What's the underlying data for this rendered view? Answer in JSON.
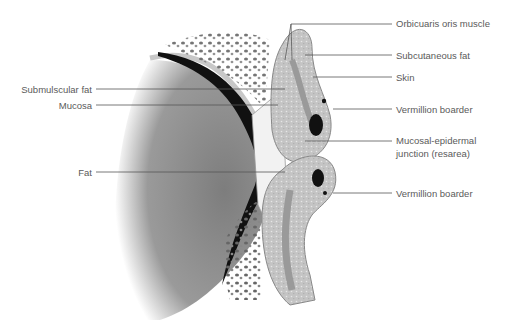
{
  "figure": {
    "type": "anatomical cross-section diagram"
  },
  "labels_right": [
    {
      "id": "orbicularis",
      "text": "Orbicuaris oris muscle"
    },
    {
      "id": "subcutaneous",
      "text": "Subcutaneous fat"
    },
    {
      "id": "skin",
      "text": "Skin"
    },
    {
      "id": "vermillion_upper",
      "text": "Vermillion boarder"
    },
    {
      "id": "mucosal_junction_1",
      "text": "Mucosal-epidermal"
    },
    {
      "id": "mucosal_junction_2",
      "text": "junction (resarea)"
    },
    {
      "id": "vermillion_lower",
      "text": "Vermillion boarder"
    }
  ],
  "labels_left": [
    {
      "id": "submuscular",
      "text": "Submulscular fat"
    },
    {
      "id": "mucosa",
      "text": "Mucosa"
    },
    {
      "id": "fat",
      "text": "Fat"
    }
  ],
  "colors": {
    "leader_line": "#555555",
    "label_text": "#5a5a5a",
    "muscle": "#8a8a8a",
    "mucosa_dark": "#111111",
    "lip_tissue": "#bdbdbd",
    "background": "#ffffff"
  }
}
